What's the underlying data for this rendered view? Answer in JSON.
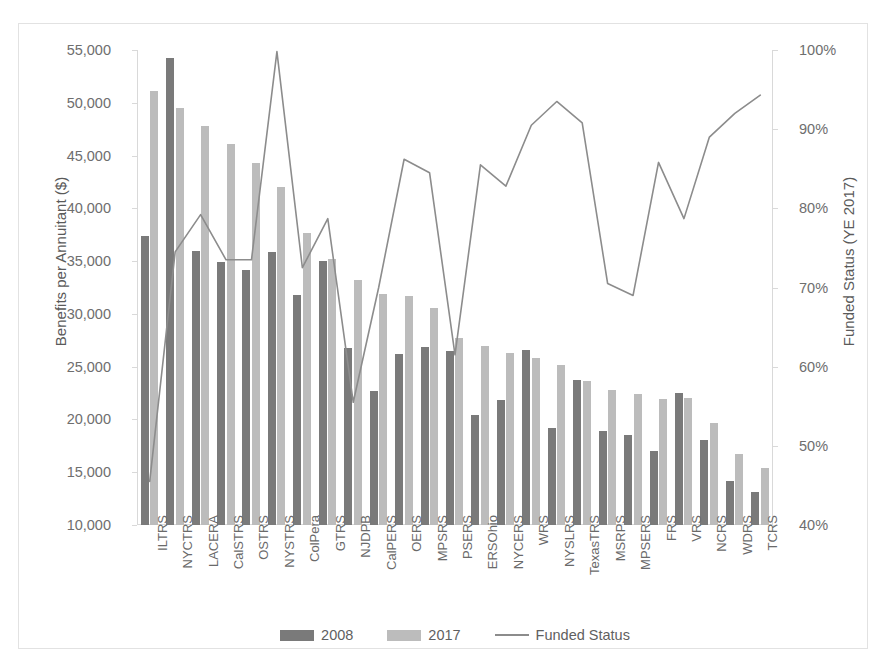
{
  "chart_data": {
    "type": "bar",
    "title": "",
    "xlabel": "",
    "ylabel": "Benefits per Annuitant ($)",
    "ylabel_secondary": "Funded Status (YE 2017)",
    "ylim": [
      10000,
      55000
    ],
    "ylim_secondary": [
      0.4,
      1.0
    ],
    "ytick_labels": [
      "55,000",
      "50,000",
      "45,000",
      "40,000",
      "35,000",
      "30,000",
      "25,000",
      "20,000",
      "15,000",
      "10,000"
    ],
    "ytick_values": [
      55000,
      50000,
      45000,
      40000,
      35000,
      30000,
      25000,
      20000,
      15000,
      10000
    ],
    "ytick_labels_secondary": [
      "100%",
      "90%",
      "80%",
      "70%",
      "60%",
      "50%",
      "40%"
    ],
    "ytick_values_secondary": [
      1.0,
      0.9,
      0.8,
      0.7,
      0.6,
      0.5,
      0.4
    ],
    "grid": false,
    "legend_position": "bottom",
    "categories": [
      "ILTRS",
      "NYCTRS",
      "LACERA",
      "CalSTRS",
      "OSTRS",
      "NYSTRS",
      "ColPera",
      "GTRS",
      "NJDPB",
      "CalPERS",
      "OERS",
      "MPSRS",
      "PSERS",
      "ERSOhio",
      "NYCERS",
      "WRS",
      "NYSLRS",
      "TexasTRS",
      "MSRPS",
      "MPSERS",
      "FRS",
      "VRS",
      "NCRS",
      "WDRS",
      "TCRS"
    ],
    "series": [
      {
        "name": "2008",
        "type": "bar",
        "color": "#7a7a7a",
        "axis": "left",
        "values": [
          37400,
          54200,
          36000,
          34900,
          34200,
          35900,
          31800,
          35000,
          26800,
          22700,
          26200,
          26900,
          26500,
          20400,
          21800,
          26600,
          19200,
          23700,
          18900,
          18500,
          17000,
          22500,
          18100,
          14200,
          13100
        ]
      },
      {
        "name": "2017",
        "type": "bar",
        "color": "#bcbcbc",
        "axis": "left",
        "values": [
          51100,
          49500,
          47800,
          46100,
          44300,
          42000,
          37700,
          35200,
          33200,
          31900,
          31700,
          30600,
          27700,
          27000,
          26300,
          25800,
          25200,
          23600,
          22800,
          22400,
          21900,
          22000,
          19700,
          16700,
          15400
        ]
      },
      {
        "name": "Funded Status",
        "type": "line",
        "color": "#8c8c8c",
        "axis": "right",
        "values": [
          0.455,
          0.745,
          0.792,
          0.735,
          0.735,
          0.998,
          0.725,
          0.787,
          0.555,
          0.7,
          0.862,
          0.845,
          0.615,
          0.855,
          0.828,
          0.905,
          0.935,
          0.908,
          0.705,
          0.69,
          0.858,
          0.787,
          0.89,
          0.92,
          0.943
        ]
      }
    ],
    "legend": [
      "2008",
      "2017",
      "Funded Status"
    ]
  }
}
